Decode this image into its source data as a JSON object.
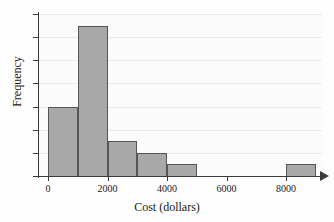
{
  "chart_data": {
    "type": "bar",
    "title": "",
    "xlabel": "Cost (dollars)",
    "ylabel": "Frequency",
    "xlim": [
      0,
      9500
    ],
    "ylim": [
      0,
      14
    ],
    "grid": true,
    "legend": "none",
    "bin_width": 1000,
    "categories": [
      "0-1000",
      "1000-2000",
      "2000-3000",
      "3000-4000",
      "4000-5000",
      "5000-6000",
      "6000-7000",
      "7000-8000",
      "8000-9000"
    ],
    "bin_edges": [
      0,
      1000,
      2000,
      3000,
      4000,
      5000,
      6000,
      7000,
      8000,
      9000
    ],
    "values": [
      6,
      13,
      3,
      2,
      1,
      0,
      0,
      0,
      1
    ],
    "x_ticks": [
      0,
      2000,
      4000,
      6000,
      8000
    ],
    "x_tick_labels": [
      "0",
      "2000",
      "4000",
      "6000",
      "8000"
    ],
    "y_ticks": [
      0,
      2,
      4,
      6,
      8,
      10,
      12,
      14
    ],
    "y_tick_labels": [
      "0",
      "2",
      "4",
      "6",
      "8",
      "10",
      "12",
      "14"
    ],
    "bar_fill_color": "#a8a8a8",
    "bar_edge_color": "#555555",
    "axis_color": "#3a3a3a",
    "grid_color": "#e9e9e9",
    "background_color": "#fbfbfb"
  }
}
